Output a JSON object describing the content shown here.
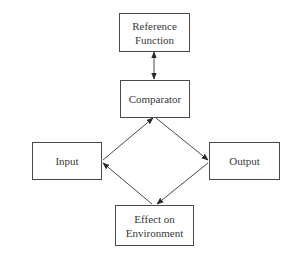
{
  "diagram": {
    "type": "control-loop",
    "nodes": [
      {
        "id": "reference",
        "label": "Reference\nFunction"
      },
      {
        "id": "comparator",
        "label": "Comparator"
      },
      {
        "id": "input",
        "label": "Input"
      },
      {
        "id": "output",
        "label": "Output"
      },
      {
        "id": "effect",
        "label": "Effect on\nEnvironment"
      }
    ],
    "edges": [
      {
        "from": "reference",
        "to": "comparator",
        "bidirectional": true
      },
      {
        "from": "input",
        "to": "comparator",
        "bidirectional": false
      },
      {
        "from": "comparator",
        "to": "output",
        "bidirectional": false
      },
      {
        "from": "output",
        "to": "effect",
        "bidirectional": false
      },
      {
        "from": "effect",
        "to": "input",
        "bidirectional": false
      }
    ],
    "colors": {
      "stroke": "#4a4a4a",
      "text": "#3a3a3a",
      "background": "#ffffff"
    }
  }
}
